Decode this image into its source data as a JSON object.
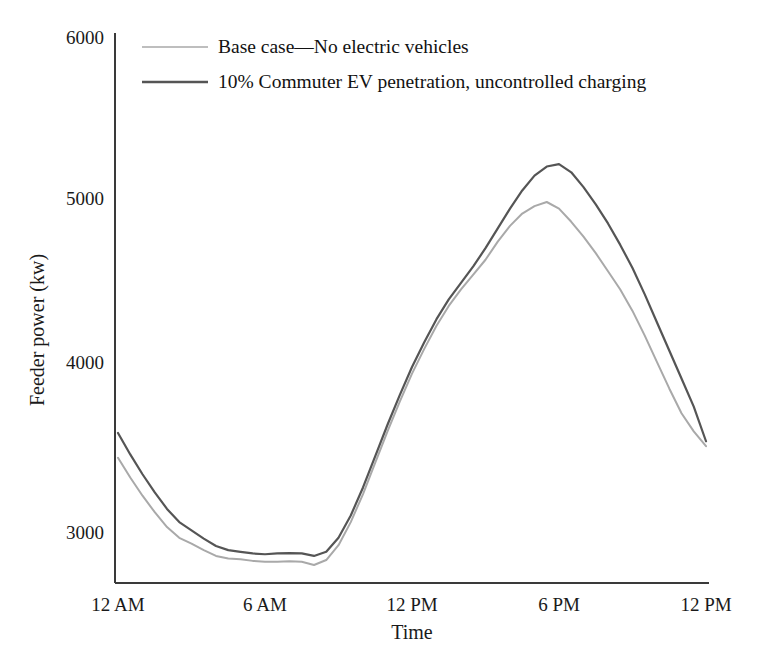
{
  "chart_data": {
    "type": "line",
    "title": "",
    "subtitle": "",
    "xlabel": "Time",
    "ylabel": "Feeder power (kw)",
    "xlim": [
      0,
      24
    ],
    "ylim": [
      2650,
      6000
    ],
    "grid": false,
    "legend_position": "top-left-inside",
    "x_tick_labels": [
      "12 AM",
      "6 AM",
      "12 PM",
      "6 PM",
      "12 PM"
    ],
    "x_tick_values": [
      0,
      6,
      12,
      18,
      24
    ],
    "y_tick_labels": [
      "3000",
      "4000",
      "5000",
      "6000"
    ],
    "y_tick_values": [
      3000,
      4000,
      5000,
      6000
    ],
    "x": [
      0,
      0.5,
      1,
      1.5,
      2,
      2.5,
      3,
      3.5,
      4,
      4.5,
      5,
      5.5,
      6,
      6.5,
      7,
      7.5,
      8,
      8.5,
      9,
      9.5,
      10,
      10.5,
      11,
      11.5,
      12,
      12.5,
      13,
      13.5,
      14,
      14.5,
      15,
      15.5,
      16,
      16.5,
      17,
      17.5,
      18,
      18.5,
      19,
      19.5,
      20,
      20.5,
      21,
      21.5,
      22,
      22.5,
      23,
      23.5,
      24
    ],
    "series": [
      {
        "name": "Base case—No electric vehicles",
        "color": "#a9a9a9",
        "width": 2.0,
        "values": [
          3450,
          3330,
          3220,
          3120,
          3030,
          2965,
          2930,
          2890,
          2855,
          2840,
          2835,
          2825,
          2820,
          2820,
          2822,
          2820,
          2800,
          2830,
          2920,
          3060,
          3230,
          3420,
          3610,
          3790,
          3960,
          4110,
          4250,
          4370,
          4470,
          4560,
          4650,
          4760,
          4855,
          4930,
          4975,
          5000,
          4960,
          4880,
          4790,
          4690,
          4580,
          4470,
          4340,
          4190,
          4030,
          3870,
          3720,
          3610,
          3520
        ]
      },
      {
        "name": "10% Commuter EV penetration, uncontrolled charging",
        "color": "#555555",
        "width": 2.2,
        "values": [
          3600,
          3470,
          3350,
          3240,
          3140,
          3060,
          3010,
          2960,
          2915,
          2890,
          2880,
          2870,
          2865,
          2870,
          2872,
          2870,
          2855,
          2880,
          2965,
          3100,
          3270,
          3460,
          3650,
          3830,
          4000,
          4150,
          4290,
          4410,
          4510,
          4610,
          4720,
          4840,
          4960,
          5070,
          5160,
          5215,
          5230,
          5180,
          5090,
          4985,
          4870,
          4740,
          4600,
          4440,
          4270,
          4100,
          3930,
          3760,
          3550
        ]
      }
    ],
    "legend_entries": [
      {
        "label": "Base case—No electric vehicles",
        "color": "#a9a9a9"
      },
      {
        "label": "10% Commuter EV penetration, uncontrolled charging",
        "color": "#555555"
      }
    ]
  },
  "axes": {
    "y_axis_title": "Feeder power (kw)",
    "x_axis_title": "Time"
  }
}
